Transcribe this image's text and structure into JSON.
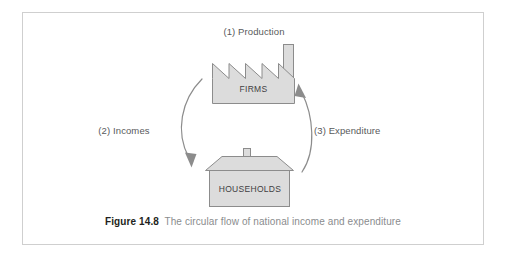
{
  "figure": {
    "caption_number": "Figure 14.8",
    "caption_text": "The circular flow of national income and expenditure"
  },
  "nodes": {
    "firms": {
      "label": "FIRMS",
      "shape": "factory-with-chimney",
      "fill": "#dcdcdc",
      "stroke": "#8c8c8c"
    },
    "households": {
      "label": "HOUSEHOLDS",
      "shape": "house-with-chimney",
      "fill": "#dcdcdc",
      "stroke": "#8c8c8c"
    }
  },
  "flows": [
    {
      "id": "production",
      "label": "(1) Production",
      "position": "top"
    },
    {
      "id": "incomes",
      "label": "(2) Incomes",
      "position": "left",
      "direction": "firms-to-households"
    },
    {
      "id": "expenditure",
      "label": "(3) Expenditure",
      "position": "right",
      "direction": "households-to-firms"
    }
  ],
  "colors": {
    "frame_border": "#cfcfcf",
    "shape_fill": "#dcdcdc",
    "shape_stroke": "#8c8c8c",
    "arrow": "#8c8c8c",
    "label_text": "#58595b",
    "node_text": "#414042",
    "caption_bold": "#231f20",
    "caption_regular": "#8a8c8e",
    "background": "#ffffff"
  }
}
